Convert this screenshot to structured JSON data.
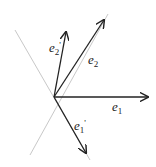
{
  "diagram": {
    "origin": [
      54,
      97
    ],
    "colors": {
      "vector": "#222222",
      "axis_line": "#c8c8c8",
      "background": "#ffffff"
    },
    "axis_lines": [
      {
        "name": "line-a",
        "from": [
          15,
          30
        ],
        "to": [
          90,
          160
        ]
      },
      {
        "name": "line-b",
        "from": [
          30,
          155
        ],
        "to": [
          108,
          14
        ]
      }
    ],
    "vectors": [
      {
        "name": "e1",
        "base": "e",
        "sub": "1",
        "prime": "",
        "end": [
          148,
          97
        ],
        "label_pos": [
          112,
          111
        ]
      },
      {
        "name": "e2",
        "base": "e",
        "sub": "2",
        "prime": "",
        "end": [
          104,
          20
        ],
        "label_pos": [
          88,
          64
        ]
      },
      {
        "name": "e2-prime",
        "base": "e",
        "sub": "2",
        "prime": "'",
        "end": [
          66,
          32
        ],
        "label_pos": [
          49,
          52
        ]
      },
      {
        "name": "e1-prime",
        "base": "e",
        "sub": "1",
        "prime": "'",
        "end": [
          86,
          153
        ],
        "label_pos": [
          74,
          130
        ]
      }
    ]
  }
}
